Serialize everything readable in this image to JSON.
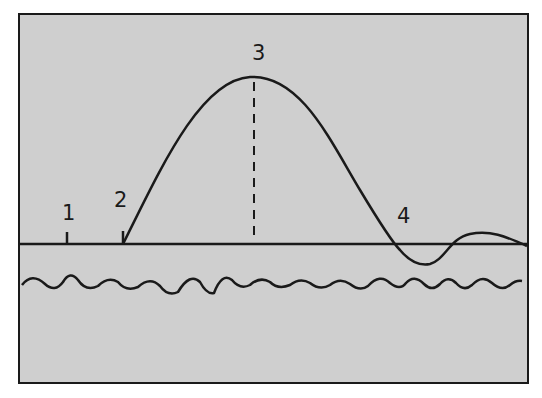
{
  "diagram": {
    "type": "waveform-schematic",
    "background_color": "#cfcfcf",
    "line_color": "#1a1a1a",
    "labels": [
      {
        "id": "1",
        "text": "1",
        "x": 68,
        "y": 212
      },
      {
        "id": "2",
        "text": "2",
        "x": 120,
        "y": 200
      },
      {
        "id": "3",
        "text": "3",
        "x": 258,
        "y": 52
      },
      {
        "id": "4",
        "text": "4",
        "x": 405,
        "y": 215
      }
    ],
    "baseline": {
      "y": 244
    },
    "markers": [
      {
        "label": "1",
        "x": 66,
        "style": "tick"
      },
      {
        "label": "2",
        "x": 123,
        "style": "tick"
      },
      {
        "label": "3",
        "x": 253,
        "style": "dashed-vertical",
        "y_top": 78,
        "y_bottom": 244
      }
    ],
    "main_wave": {
      "description": "Large single hump rising from marker 2, peaking at marker 3, descending below baseline near label 4, then a small positive rebound returning to baseline at right edge"
    },
    "noise_wave": {
      "description": "Small irregular sinusoidal oscillation running horizontally across the frame below the baseline",
      "y_center": 284
    }
  }
}
